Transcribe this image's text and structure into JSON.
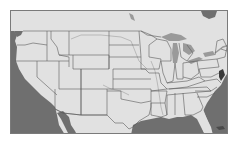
{
  "map": {
    "title": "Continental United States",
    "region": "USA (lower 48) with state boundaries",
    "colors": {
      "land": "#e1e1e1",
      "water": "#6f6f6f",
      "lakes": "#9a9a9a",
      "borders": "#5a5a5a",
      "rivers": "#a8a8a8",
      "frame": "#7a7a7a"
    },
    "water_bodies": [
      "Pacific Ocean",
      "Gulf of Mexico",
      "Atlantic Ocean",
      "Great Lakes",
      "Gulf of California"
    ]
  }
}
